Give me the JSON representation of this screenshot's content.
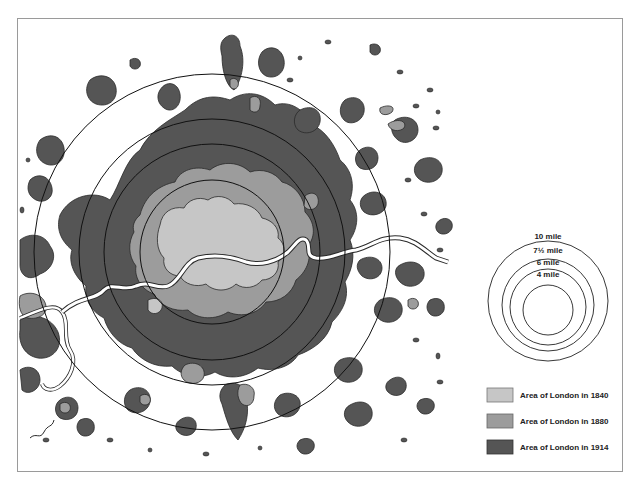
{
  "map": {
    "subject": "Growth of London",
    "colors": {
      "area_1840": "#c6c6c6",
      "area_1880": "#9c9c9c",
      "area_1914": "#555555",
      "outline": "#2a2a2a",
      "river": "#ffffff",
      "frame": "#9a9a9a"
    },
    "center": {
      "x": 212,
      "y": 252
    },
    "rings": [
      {
        "label": "10 mile",
        "r": 178
      },
      {
        "label": "7½ mile",
        "r": 133
      },
      {
        "label": "6 mile",
        "r": 108
      },
      {
        "label": "4 mile",
        "r": 72
      }
    ]
  },
  "scale_legend": {
    "center": {
      "x": 548,
      "y": 301
    },
    "rings": [
      {
        "label": "10 mile",
        "r": 60
      },
      {
        "label": "7½ mile",
        "r": 46
      },
      {
        "label": "6 mile",
        "r": 38
      },
      {
        "label": "4 mile",
        "r": 25
      }
    ]
  },
  "legend": {
    "items": [
      {
        "label": "Area of London in 1840",
        "color": "#c6c6c6"
      },
      {
        "label": "Area of London in 1880",
        "color": "#9c9c9c"
      },
      {
        "label": "Area of London in 1914",
        "color": "#555555"
      }
    ]
  }
}
